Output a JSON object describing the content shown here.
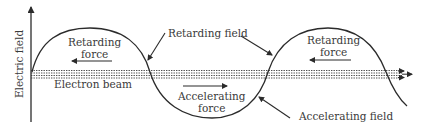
{
  "diagram": {
    "axis": {
      "y_label": "Electric field"
    },
    "labels": {
      "retarding_force_1": [
        "Retarding",
        "force"
      ],
      "retarding_force_2": [
        "Retarding",
        "force"
      ],
      "accelerating_force": [
        "Accelerating",
        "force"
      ],
      "retarding_field": "Retarding field",
      "accelerating_field": "Accelerating field",
      "electron_beam": "Electron beam"
    },
    "colors": {
      "line": "#2b2b2b",
      "text": "#3a3a3a",
      "background": "#ffffff"
    }
  }
}
